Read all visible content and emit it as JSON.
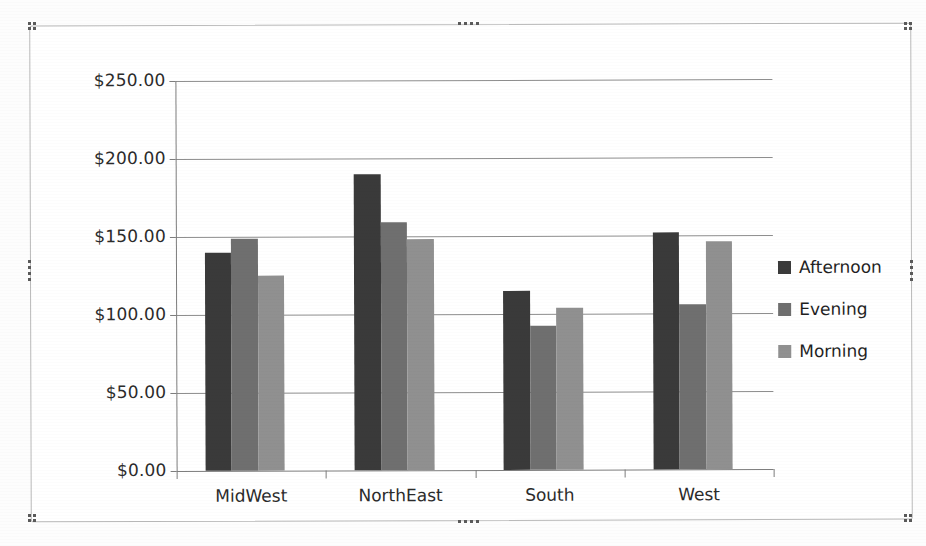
{
  "app": {
    "object_type": "chart-object",
    "selected": "true"
  },
  "chart_data": {
    "type": "bar",
    "title": "",
    "subtitle": "",
    "xlabel": "",
    "ylabel": "",
    "categories": [
      "MidWest",
      "NorthEast",
      "South",
      "West"
    ],
    "series": [
      {
        "name": "Afternoon",
        "color": "#3a3a3a",
        "values": [
          140,
          190,
          115,
          152
        ]
      },
      {
        "name": "Evening",
        "color": "#6f6f6f",
        "values": [
          149,
          159,
          92,
          106
        ]
      },
      {
        "name": "Morning",
        "color": "#909090",
        "values": [
          125,
          148,
          104,
          146
        ]
      }
    ],
    "ylim": [
      0,
      250
    ],
    "ytick_values": [
      0,
      50,
      100,
      150,
      200,
      250
    ],
    "ytick_labels": [
      "$0.00",
      "$50.00",
      "$100.00",
      "$150.00",
      "$200.00",
      "$250.00"
    ],
    "grid": "horizontal",
    "legend_position": "right",
    "value_prefix": "$",
    "number_format": "currency-2dp"
  },
  "legend": {
    "items": [
      {
        "label": "Afternoon",
        "color": "#3a3a3a"
      },
      {
        "label": "Evening",
        "color": "#6f6f6f"
      },
      {
        "label": "Morning",
        "color": "#909090"
      }
    ]
  },
  "selection_handles": {
    "positions": [
      "top-left",
      "top-center",
      "top-right",
      "middle-left",
      "middle-right",
      "bottom-left",
      "bottom-center",
      "bottom-right"
    ]
  }
}
